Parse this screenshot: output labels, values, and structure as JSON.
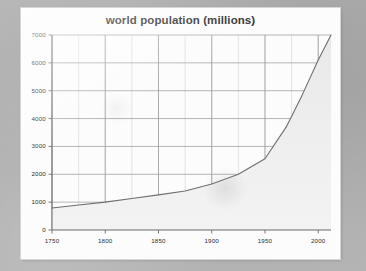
{
  "page": {
    "background_color": "#b2b2b2",
    "card_color": "#fcfcfc"
  },
  "chart_data": {
    "type": "area",
    "title": "world population (millions)",
    "subtitle": "",
    "xlabel": "",
    "ylabel": "",
    "xlim": [
      1750,
      2012
    ],
    "ylim": [
      0,
      7000
    ],
    "grid": true,
    "legend": "none",
    "x_ticks": [
      1750,
      1800,
      1850,
      1900,
      1950,
      2000
    ],
    "x_tick_labels": [
      "1750",
      "1800",
      "1850",
      "1900",
      "1950",
      "2000"
    ],
    "x_minor_step": 25,
    "y_ticks": [
      0,
      1000,
      2000,
      3000,
      4000,
      5000,
      6000,
      7000
    ],
    "y_tick_labels": [
      "0",
      "1000",
      "2000",
      "3000",
      "4000",
      "5000",
      "6000",
      "7000"
    ],
    "series": [
      {
        "name": "world population",
        "line_color": "#6e6e6e",
        "fill_color": "#e9e9e9",
        "x": [
          1750,
          1775,
          1800,
          1825,
          1850,
          1875,
          1900,
          1925,
          1950,
          1970,
          1985,
          2000,
          2012
        ],
        "values": [
          790,
          900,
          1000,
          1130,
          1260,
          1400,
          1650,
          2000,
          2560,
          3700,
          4850,
          6100,
          7000
        ]
      }
    ],
    "annotations": []
  }
}
